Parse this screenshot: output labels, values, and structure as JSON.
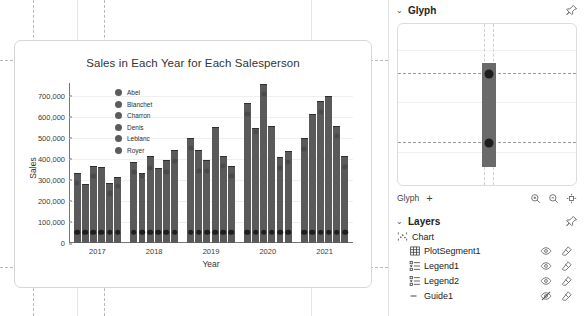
{
  "chart_data": {
    "type": "bar",
    "title": "Sales in Each Year for Each Salesperson",
    "xlabel": "Year",
    "ylabel": "Sales",
    "ylim": [
      0,
      760000
    ],
    "yticks": [
      "0",
      "100,000",
      "200,000",
      "300,000",
      "400,000",
      "500,000",
      "600,000",
      "700,000"
    ],
    "ytick_values": [
      0,
      100000,
      200000,
      300000,
      400000,
      500000,
      600000,
      700000
    ],
    "categories": [
      "2017",
      "2018",
      "2019",
      "2020",
      "2021"
    ],
    "legend_title": "",
    "series": [
      {
        "name": "Abel",
        "values": [
          333000,
          385000,
          500000,
          663000,
          497000
        ]
      },
      {
        "name": "Blanchet",
        "values": [
          278000,
          332000,
          443000,
          544000,
          613000
        ]
      },
      {
        "name": "Charron",
        "values": [
          368000,
          412000,
          395000,
          757000,
          675000
        ]
      },
      {
        "name": "Denis",
        "values": [
          362000,
          355000,
          553000,
          558000,
          697000
        ]
      },
      {
        "name": "Leblanc",
        "values": [
          285000,
          392000,
          415000,
          408000,
          558000
        ]
      },
      {
        "name": "Royer",
        "values": [
          314000,
          444000,
          368000,
          437000,
          414000
        ]
      }
    ],
    "marker_series": {
      "name": "marker-high",
      "values": [
        [
          296000,
          348000,
          463000,
          625000,
          458000
        ],
        [
          null,
          332000,
          355000,
          538000,
          null
        ],
        [
          330000,
          369000,
          353000,
          718000,
          634000
        ],
        [
          null,
          null,
          null,
          null,
          null
        ],
        [
          247000,
          350000,
          378000,
          370000,
          521000
        ],
        [
          281000,
          402000,
          329000,
          398000,
          374000
        ]
      ]
    },
    "baseline_marker_value": 65000,
    "grid": true,
    "legend_position": "inside-top-left"
  },
  "glyph_panel": {
    "title": "Glyph",
    "caret": "chevron-down-icon",
    "pin": "pin-icon",
    "toolbar": {
      "label": "Glyph",
      "add": "+",
      "zoom_in": "zoom-in-icon",
      "zoom_out": "zoom-out-icon",
      "fit": "fit-icon"
    }
  },
  "layers_panel": {
    "title": "Layers",
    "caret": "chevron-down-icon",
    "pin": "pin-icon",
    "root": {
      "label": "Chart",
      "icon": "chart-icon"
    },
    "items": [
      {
        "label": "PlotSegment1",
        "icon": "grid-icon",
        "visible": true,
        "eye": "eye-icon",
        "erase": "eraser-icon"
      },
      {
        "label": "Legend1",
        "icon": "legend-icon",
        "visible": true,
        "eye": "eye-icon",
        "erase": "eraser-icon"
      },
      {
        "label": "Legend2",
        "icon": "legend-icon",
        "visible": true,
        "eye": "eye-icon",
        "erase": "eraser-icon"
      },
      {
        "label": "Guide1",
        "icon": "guide-icon",
        "visible": false,
        "eye": "eye-off-icon",
        "erase": "eraser-icon"
      }
    ]
  },
  "colors": {
    "bar": "#5a5a5a",
    "bar_edge": "#2f2f2f",
    "marker": "#1f1f1f",
    "guide": "#b9b9b9",
    "panel_border": "#dcdcdc"
  }
}
